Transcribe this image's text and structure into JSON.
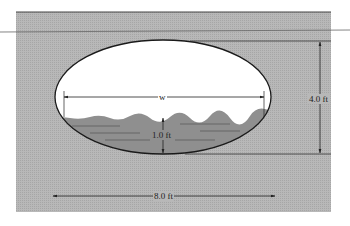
{
  "figure": {
    "type": "cross-section of elliptical culvert partially filled with water",
    "colors": {
      "background": "#ffffff",
      "ground": "#b3b3b3",
      "water": "#8f8f8f",
      "opening": "#ffffff",
      "lines": "#222222"
    },
    "labels": {
      "width_w": "w",
      "water_depth": "1.0 ft",
      "height": "4.0 ft",
      "span": "8.0 ft"
    },
    "dimensions": {
      "major_axis_ft": 8.0,
      "minor_axis_ft": 4.0,
      "water_depth_ft": 1.0
    }
  }
}
